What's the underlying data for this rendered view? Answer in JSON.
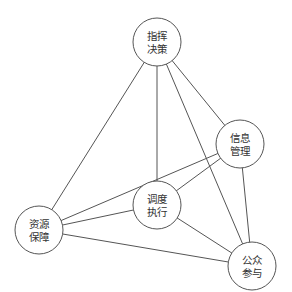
{
  "diagram": {
    "type": "network",
    "colors": {
      "stroke": "#555555",
      "text": "#333333",
      "background": "#ffffff"
    },
    "nodes": [
      {
        "id": "command",
        "line1": "指挥",
        "line2": "决策",
        "cx": 157,
        "cy": 42,
        "r": 24
      },
      {
        "id": "info",
        "line1": "信息",
        "line2": "管理",
        "cx": 240,
        "cy": 144,
        "r": 24
      },
      {
        "id": "dispatch",
        "line1": "调度",
        "line2": "执行",
        "cx": 157,
        "cy": 205,
        "r": 24
      },
      {
        "id": "resource",
        "line1": "资源",
        "line2": "保障",
        "cx": 39,
        "cy": 230,
        "r": 24
      },
      {
        "id": "public",
        "line1": "公众",
        "line2": "参与",
        "cx": 252,
        "cy": 266,
        "r": 24
      }
    ],
    "edges": [
      {
        "from": "command",
        "to": "resource"
      },
      {
        "from": "command",
        "to": "dispatch"
      },
      {
        "from": "command",
        "to": "public"
      },
      {
        "from": "command",
        "to": "info"
      },
      {
        "from": "info",
        "to": "resource"
      },
      {
        "from": "info",
        "to": "dispatch"
      },
      {
        "from": "info",
        "to": "public"
      },
      {
        "from": "dispatch",
        "to": "resource"
      },
      {
        "from": "dispatch",
        "to": "public"
      },
      {
        "from": "resource",
        "to": "public"
      }
    ]
  }
}
